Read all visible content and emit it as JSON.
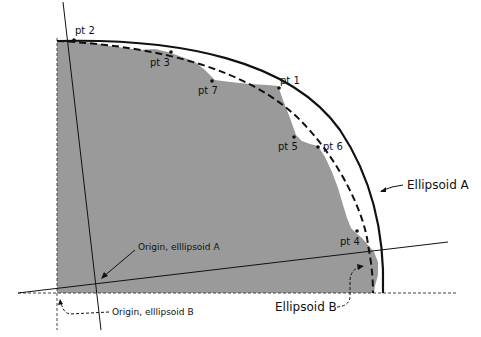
{
  "diagram": {
    "points": [
      {
        "id": "pt1",
        "label": "pt 1"
      },
      {
        "id": "pt2",
        "label": "pt 2"
      },
      {
        "id": "pt3",
        "label": "pt 3"
      },
      {
        "id": "pt4",
        "label": "pt 4"
      },
      {
        "id": "pt5",
        "label": "pt 5"
      },
      {
        "id": "pt6",
        "label": "pt 6"
      },
      {
        "id": "pt7",
        "label": "pt 7"
      }
    ],
    "labels": {
      "ellipsoid_a": "Ellipsoid A",
      "ellipsoid_b": "Ellipsoid B",
      "origin_a": "Origin, elllipsoid A",
      "origin_b": "Origin, elllipsoid B"
    },
    "colors": {
      "terrain_fill": "#9a9a9a",
      "lines": "#111111",
      "background": "#ffffff"
    }
  }
}
